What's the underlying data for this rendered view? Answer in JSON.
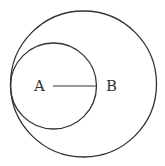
{
  "diagram": {
    "stroke_color": "#333333",
    "big_circle": {
      "cx": 83.5,
      "cy": 84,
      "r": 73
    },
    "small_circle": {
      "cx": 53,
      "cy": 86,
      "r": 43
    },
    "segment": {
      "x1": 53,
      "y1": 86,
      "x2": 96,
      "y2": 86
    },
    "labels": {
      "a": "A",
      "b": "B"
    }
  }
}
